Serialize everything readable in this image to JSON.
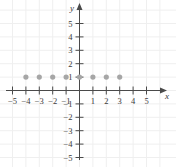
{
  "figure": {
    "kind": "cartesian-coordinate-plane",
    "background_color": "#ffffff",
    "grid_color": "#efefef",
    "axis_color": "#4a4a4a",
    "tick_color": "#4a4a4a",
    "label_color": "#3a3a3a",
    "point_color": "#a6a6a6",
    "point_radius_px": 2.6
  },
  "axis_labels": {
    "x": "x",
    "y": "y"
  },
  "x_tick_labels": [
    "−5",
    "−4",
    "−3",
    "−2",
    "−1",
    "1",
    "2",
    "3",
    "4",
    "5"
  ],
  "y_tick_labels": [
    "5",
    "4",
    "3",
    "2",
    "1",
    "−1",
    "−2",
    "−3",
    "−4",
    "−5"
  ],
  "chart_data": {
    "type": "scatter",
    "title": "",
    "xlabel": "x",
    "ylabel": "y",
    "grid": true,
    "legend": null,
    "xlim": [
      -5.8,
      5.8
    ],
    "ylim": [
      -5.8,
      5.8
    ],
    "xticks": [
      -5,
      -4,
      -3,
      -2,
      -1,
      1,
      2,
      3,
      4,
      5
    ],
    "yticks": [
      5,
      4,
      3,
      2,
      1,
      -1,
      -2,
      -3,
      -4,
      -5
    ],
    "series": [
      {
        "name": "plotted points",
        "marker": "filled-circle",
        "color": "#a6a6a6",
        "x": [
          -4,
          -3,
          -2,
          -1,
          0,
          1,
          2,
          3
        ],
        "y": [
          1,
          1,
          1,
          1,
          1,
          1,
          1,
          1
        ],
        "points": [
          [
            -4,
            1
          ],
          [
            -3,
            1
          ],
          [
            -2,
            1
          ],
          [
            -1,
            1
          ],
          [
            0,
            1
          ],
          [
            1,
            1
          ],
          [
            2,
            1
          ],
          [
            3,
            1
          ]
        ]
      }
    ]
  }
}
